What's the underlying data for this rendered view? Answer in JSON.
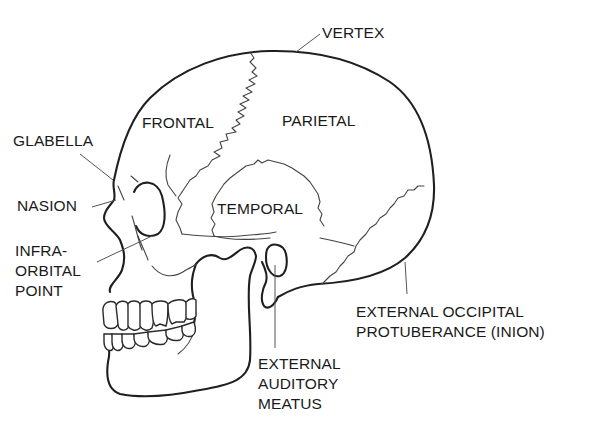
{
  "diagram": {
    "colors": {
      "background": "#ffffff",
      "line": "#1f1f1f",
      "text": "#1a1a1a"
    },
    "labels": {
      "vertex": "VERTEX",
      "frontal": "FRONTAL",
      "parietal": "PARIETAL",
      "temporal": "TEMPORAL",
      "glabella": "GLABELLA",
      "nasion": "NASION",
      "infraorbital_point": "INFRA-\nORBITAL\nPOINT",
      "external_auditory_meatus": "EXTERNAL\nAUDITORY\nMEATUS",
      "external_occipital_protuberance": "EXTERNAL OCCIPITAL\nPROTUBERANCE (INION)"
    }
  }
}
